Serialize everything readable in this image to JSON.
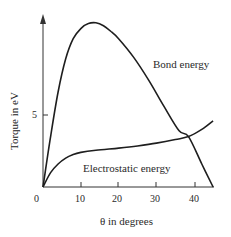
{
  "chart_data": {
    "type": "line",
    "title": "",
    "xlabel": "θ in degrees",
    "ylabel": "Torque in eV",
    "xlim": [
      0,
      46
    ],
    "ylim": [
      0,
      12.5
    ],
    "x_ticks": [
      0,
      10,
      20,
      30,
      40
    ],
    "x_tick_labels": [
      "0",
      "10",
      "20",
      "30",
      "40"
    ],
    "y_ticks": [
      5
    ],
    "y_tick_labels": [
      "5"
    ],
    "grid": false,
    "legend": "inline labels",
    "series": [
      {
        "name": "Bond energy",
        "x": [
          0,
          2,
          4,
          6,
          8,
          10,
          12,
          14,
          16,
          18,
          20,
          24,
          28,
          32,
          36,
          38.5,
          42,
          45
        ],
        "y": [
          0,
          3.5,
          6.6,
          8.9,
          10.3,
          11.0,
          11.35,
          11.4,
          11.2,
          10.8,
          10.3,
          9.0,
          7.4,
          5.6,
          3.9,
          3.5,
          1.6,
          0
        ]
      },
      {
        "name": "Electrostatic energy",
        "x": [
          0,
          2,
          4,
          6,
          8,
          10,
          14,
          20,
          25,
          30,
          35,
          38.5,
          42,
          45
        ],
        "y": [
          0,
          1.0,
          1.6,
          2.0,
          2.25,
          2.4,
          2.55,
          2.7,
          2.85,
          3.05,
          3.3,
          3.5,
          4.0,
          4.6
        ]
      }
    ],
    "annotations": [
      {
        "text": "Bond energy",
        "x": 29,
        "y": 8.6
      },
      {
        "text": "Electrostatic energy",
        "x": 13,
        "y": 1.9
      }
    ]
  },
  "labels": {
    "bond": "Bond energy",
    "electrostatic": "Electrostatic energy",
    "xlabel": "θ in degrees",
    "ylabel": "Torque in eV",
    "x0": "0",
    "x10": "10",
    "x20": "20",
    "x30": "30",
    "x40": "40",
    "y5": "5"
  },
  "colors": {
    "line": "#1e1e1e",
    "axis": "#333333",
    "text": "#2a2a2a"
  }
}
